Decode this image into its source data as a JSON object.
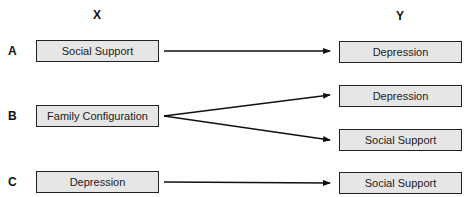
{
  "headers": {
    "x": "X",
    "y": "Y"
  },
  "rows": [
    {
      "label": "A",
      "source": "Social Support",
      "targets": [
        "Depression"
      ]
    },
    {
      "label": "B",
      "source": "Family Configuration",
      "targets": [
        "Depression",
        "Social Support"
      ]
    },
    {
      "label": "C",
      "source": "Depression",
      "targets": [
        "Social Support"
      ]
    }
  ],
  "colors": {
    "box_fill": "#e6e6e6",
    "stroke": "#222222"
  }
}
